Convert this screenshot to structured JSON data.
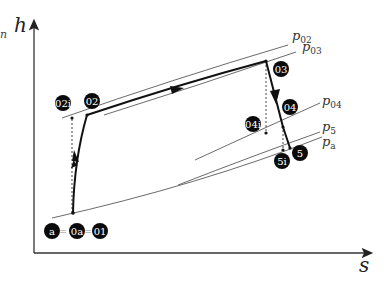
{
  "diagram": {
    "type": "h-s diagram (turbojet/gas-turbine enthalpy-entropy)",
    "axes": {
      "y_label": "h",
      "x_label": "s"
    },
    "stray_glyph": "n",
    "isobars": [
      {
        "id": "p02",
        "label": "p",
        "sub": "02"
      },
      {
        "id": "p03",
        "label": "p",
        "sub": "03"
      },
      {
        "id": "p04",
        "label": "p",
        "sub": "04"
      },
      {
        "id": "p5",
        "label": "p",
        "sub": "5"
      },
      {
        "id": "pa",
        "label": "p",
        "sub": "a"
      }
    ],
    "states": [
      {
        "id": "a",
        "label": "a"
      },
      {
        "id": "0a",
        "label": "0a"
      },
      {
        "id": "01",
        "label": "01"
      },
      {
        "id": "02i",
        "label": "02i"
      },
      {
        "id": "02",
        "label": "02"
      },
      {
        "id": "03",
        "label": "03"
      },
      {
        "id": "04",
        "label": "04"
      },
      {
        "id": "04i",
        "label": "04i"
      },
      {
        "id": "5",
        "label": "5"
      },
      {
        "id": "5i",
        "label": "5i"
      }
    ],
    "equals_sign": "=",
    "processes": [
      {
        "from": "01",
        "to": "02",
        "name": "compression",
        "arrow": "up"
      },
      {
        "from": "02",
        "to": "03",
        "name": "heat addition",
        "arrow": "right"
      },
      {
        "from": "03",
        "to": "04",
        "name": "turbine expansion",
        "arrow": "down"
      },
      {
        "from": "04",
        "to": "5",
        "name": "nozzle expansion"
      }
    ],
    "ideal_dashed_lines": [
      "01-02i",
      "03-04i",
      "04-5i"
    ]
  }
}
